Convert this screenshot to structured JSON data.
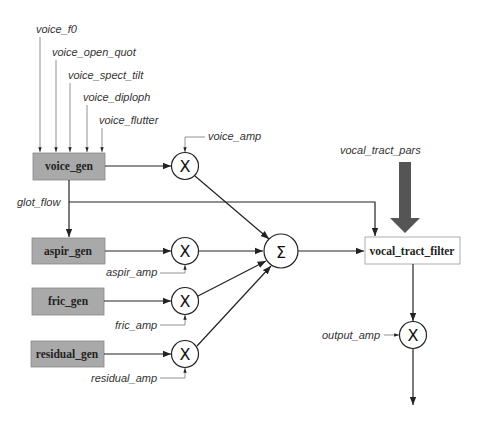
{
  "diagram": {
    "type": "signal-flow block diagram",
    "inputs_top": [
      {
        "id": "voice_f0",
        "label": "voice_f0"
      },
      {
        "id": "voice_open_quot",
        "label": "voice_open_quot"
      },
      {
        "id": "voice_spect_tilt",
        "label": "voice_spect_tilt"
      },
      {
        "id": "voice_diploph",
        "label": "voice_diploph"
      },
      {
        "id": "voice_flutter",
        "label": "voice_flutter"
      }
    ],
    "generators": [
      {
        "id": "voice_gen",
        "label": "voice_gen",
        "fill": "#a9a9a9"
      },
      {
        "id": "aspir_gen",
        "label": "aspir_gen",
        "fill": "#a9a9a9"
      },
      {
        "id": "fric_gen",
        "label": "fric_gen",
        "fill": "#a9a9a9"
      },
      {
        "id": "residual_gen",
        "label": "residual_gen",
        "fill": "#a9a9a9"
      }
    ],
    "amplitudes": [
      {
        "id": "voice_amp",
        "label": "voice_amp"
      },
      {
        "id": "aspir_amp",
        "label": "aspir_amp"
      },
      {
        "id": "fric_amp",
        "label": "fric_amp"
      },
      {
        "id": "residual_amp",
        "label": "residual_amp"
      },
      {
        "id": "output_amp",
        "label": "output_amp"
      }
    ],
    "signals": {
      "glot_flow": "glot_flow",
      "vocal_tract_pars": "vocal_tract_pars"
    },
    "operators": {
      "multiply": "X",
      "sum": "Σ"
    },
    "filter": {
      "id": "vocal_tract_filter",
      "label": "vocal_tract_filter",
      "fill": "#ffffff"
    },
    "colors": {
      "generator_fill": "#a9a9a9",
      "big_arrow": "#555555",
      "line": "#222222"
    },
    "edges": [
      [
        "voice_f0",
        "voice_gen"
      ],
      [
        "voice_open_quot",
        "voice_gen"
      ],
      [
        "voice_spect_tilt",
        "voice_gen"
      ],
      [
        "voice_diploph",
        "voice_gen"
      ],
      [
        "voice_flutter",
        "voice_gen"
      ],
      [
        "voice_gen",
        "mult_voice"
      ],
      [
        "voice_amp",
        "mult_voice"
      ],
      [
        "voice_gen",
        "glot_flow"
      ],
      [
        "glot_flow",
        "aspir_gen"
      ],
      [
        "glot_flow",
        "vocal_tract_filter"
      ],
      [
        "aspir_gen",
        "mult_aspir"
      ],
      [
        "aspir_amp",
        "mult_aspir"
      ],
      [
        "fric_gen",
        "mult_fric"
      ],
      [
        "fric_amp",
        "mult_fric"
      ],
      [
        "residual_gen",
        "mult_residual"
      ],
      [
        "residual_amp",
        "mult_residual"
      ],
      [
        "mult_voice",
        "sum"
      ],
      [
        "mult_aspir",
        "sum"
      ],
      [
        "mult_fric",
        "sum"
      ],
      [
        "mult_residual",
        "sum"
      ],
      [
        "sum",
        "vocal_tract_filter"
      ],
      [
        "vocal_tract_pars",
        "vocal_tract_filter"
      ],
      [
        "vocal_tract_filter",
        "mult_output"
      ],
      [
        "output_amp",
        "mult_output"
      ],
      [
        "mult_output",
        "output"
      ]
    ]
  }
}
